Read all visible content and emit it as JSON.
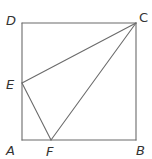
{
  "diagram": {
    "type": "geometry-figure",
    "stroke_color": "#6b6b6b",
    "label_color": "#333333",
    "vertices": {
      "A": {
        "label": "A",
        "x": 22,
        "y": 140
      },
      "B": {
        "label": "B",
        "x": 136,
        "y": 140
      },
      "C": {
        "label": "C",
        "x": 136,
        "y": 23
      },
      "D": {
        "label": "D",
        "x": 22,
        "y": 23
      },
      "E": {
        "label": "E",
        "x": 22,
        "y": 83
      },
      "F": {
        "label": "F",
        "x": 51,
        "y": 140
      }
    },
    "segments": [
      {
        "from": "A",
        "to": "B"
      },
      {
        "from": "B",
        "to": "C"
      },
      {
        "from": "C",
        "to": "D"
      },
      {
        "from": "D",
        "to": "A"
      },
      {
        "from": "C",
        "to": "E"
      },
      {
        "from": "C",
        "to": "F"
      },
      {
        "from": "E",
        "to": "F"
      }
    ],
    "labels": {
      "A": "A",
      "B": "B",
      "C": "C",
      "D": "D",
      "E": "E",
      "F": "F"
    }
  }
}
